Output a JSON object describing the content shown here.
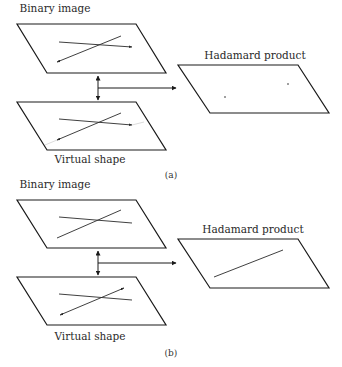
{
  "figure": {
    "panels": [
      {
        "id": "a",
        "caption": "(a)",
        "binary_label": "Binary image",
        "virtual_label": "Virtual shape",
        "hadamard_label": "Hadamard product",
        "hadamard_content": "two isolated points (intersection residues)"
      },
      {
        "id": "b",
        "caption": "(b)",
        "binary_label": "Binary image",
        "virtual_label": "Virtual shape",
        "hadamard_label": "Hadamard product",
        "hadamard_content": "one line segment (matching line)"
      }
    ],
    "colors": {
      "stroke": "#1a1a1a",
      "background": "#ffffff",
      "faint": "#d8d8d8"
    }
  }
}
